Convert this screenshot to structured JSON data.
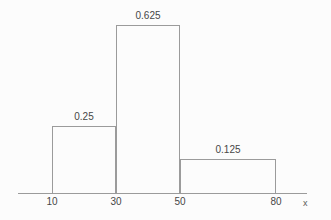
{
  "chart_data": {
    "type": "bar",
    "subtype": "histogram",
    "title": "",
    "xlabel": "x",
    "ylabel": "",
    "bins": [
      {
        "x0": 10,
        "x1": 30,
        "value": 0.25,
        "label": "0.25"
      },
      {
        "x0": 30,
        "x1": 50,
        "value": 0.625,
        "label": "0.625"
      },
      {
        "x0": 50,
        "x1": 80,
        "value": 0.125,
        "label": "0.125"
      }
    ],
    "x_ticks": [
      "10",
      "30",
      "50",
      "80"
    ],
    "x_range": [
      0,
      90
    ],
    "y_range": [
      0,
      0.65
    ],
    "grid": false,
    "legend": false,
    "bar_fill": "transparent",
    "line_color": "#9b9b9b",
    "text_color": "#474747",
    "background": "#fcfcfc"
  }
}
